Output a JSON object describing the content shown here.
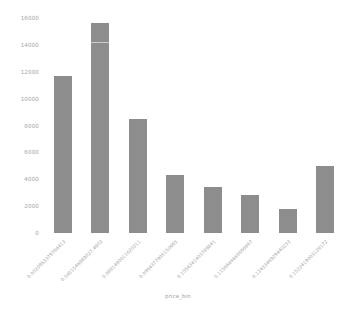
{
  "chart_data": {
    "type": "bar",
    "title": "",
    "xlabel": "price_bin",
    "ylabel": "",
    "ylim": [
      0,
      16000
    ],
    "grid": false,
    "legend": null,
    "bar_color": "#8d8d8d",
    "tick_color": "#a5a5a5",
    "background": "#ffffff",
    "categories": [
      "0.0020983379786413",
      "0.0451546969027.4903",
      "0.0881490011620311",
      "0.0964377905150985",
      "0.1054341403789841",
      "0.1156666666666667",
      "0.1243346929440233",
      "0.1523419003128172"
    ],
    "values": [
      11650,
      15600,
      8500,
      4350,
      3450,
      2800,
      1800,
      4950
    ],
    "yticks": [
      0,
      2000,
      4000,
      6000,
      8000,
      10000,
      12000,
      14000,
      16000
    ],
    "ytick_labels": [
      "0",
      "2000",
      "4000",
      "6000",
      "8000",
      "10000",
      "12000",
      "14000",
      "16000"
    ]
  }
}
